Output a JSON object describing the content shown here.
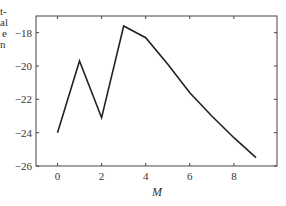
{
  "clipped_text": [
    "t-",
    "al",
    "e",
    "n"
  ],
  "chart_data": {
    "type": "line",
    "title": "",
    "xlabel": "M",
    "ylabel": "",
    "x": [
      0,
      1,
      2,
      3,
      4,
      5,
      6,
      7,
      8,
      9
    ],
    "series": [
      {
        "name": "",
        "values": [
          -24.0,
          -19.7,
          -23.1,
          -17.6,
          -18.3,
          -19.9,
          -21.6,
          -23.0,
          -24.3,
          -25.5
        ]
      }
    ],
    "xlim": [
      -1,
      9.9
    ],
    "ylim": [
      -26,
      -17
    ],
    "xticks": [
      0,
      2,
      4,
      6,
      8
    ],
    "yticks": [
      -18,
      -20,
      -22,
      -24,
      -26
    ],
    "xtick_labels": [
      "0",
      "2",
      "4",
      "6",
      "8"
    ],
    "ytick_labels": [
      "−18",
      "−20",
      "−22",
      "−24",
      "−26"
    ],
    "grid": false,
    "legend": null,
    "line_color": "#222222"
  }
}
